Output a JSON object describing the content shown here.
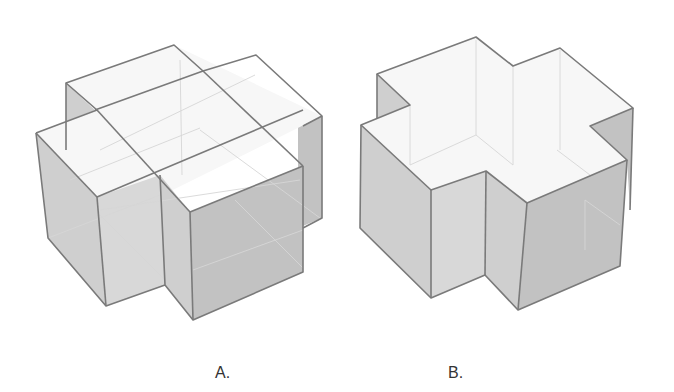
{
  "figure": {
    "options": [
      {
        "id": "A",
        "label": "A.",
        "shape": "two intersecting rectangular boxes forming a cross (transparent wireframe with internal edges)"
      },
      {
        "id": "B",
        "label": "B.",
        "shape": "solid plus/cross-shaped prism (outer surface only)"
      }
    ]
  },
  "colors": {
    "edge": "#7a7a7a",
    "top_face": "#f7f7f7",
    "side_face": "#c8c8c8",
    "background": "#ffffff"
  }
}
